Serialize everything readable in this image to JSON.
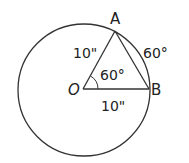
{
  "diagram": {
    "type": "geometry-circle-sector",
    "circle": {
      "cx": 84,
      "cy": 90,
      "r": 66
    },
    "points": {
      "O": {
        "label": "O",
        "x": 83,
        "y": 89
      },
      "A": {
        "label": "A",
        "x": 115,
        "y": 31
      },
      "B": {
        "label": "B",
        "x": 149,
        "y": 89
      }
    },
    "labels": {
      "A": "A",
      "B": "B",
      "O": "O",
      "side_OA": "10\"",
      "side_OB": "10\"",
      "central_angle": "60°",
      "arc_AB": "60°"
    },
    "colors": {
      "stroke": "#333333",
      "text": "#222222",
      "background": "#ffffff"
    }
  }
}
